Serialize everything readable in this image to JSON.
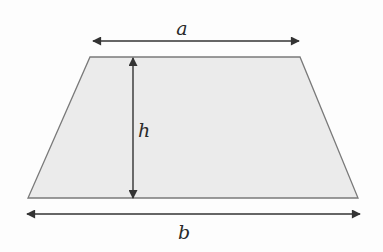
{
  "diagram": {
    "shape": "trapezoid",
    "labels": {
      "top_base": "a",
      "height": "h",
      "bottom_base": "b"
    },
    "colors": {
      "background": "#fdfdfd",
      "fill": "#ebebeb",
      "stroke": "#7a7a7a",
      "arrow": "#333333",
      "text": "#2a2a2a"
    }
  }
}
